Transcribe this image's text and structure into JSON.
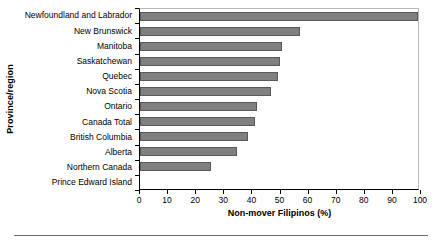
{
  "chart_data": {
    "type": "bar",
    "orientation": "horizontal",
    "title": "",
    "xlabel": "Non-mover Filipinos (%)",
    "ylabel": "Province/region",
    "xlim": [
      0,
      100
    ],
    "xticks": [
      0,
      10,
      20,
      30,
      40,
      50,
      60,
      70,
      80,
      90,
      100
    ],
    "xtick_labels": [
      "0",
      "10",
      "20",
      "30",
      "40",
      "50",
      "60",
      "70",
      "80",
      "90",
      "100"
    ],
    "grid": false,
    "legend": null,
    "bar_color": "#808080",
    "bar_edge_color": "#595959",
    "categories": [
      "Newfoundland and Labrador",
      "New Brunswick",
      "Manitoba",
      "Saskatchewan",
      "Quebec",
      "Nova Scotia",
      "Ontario",
      "Canada Total",
      "British Columbia",
      "Alberta",
      "Northern Canada",
      "Prince Edward Island"
    ],
    "values": [
      100,
      57.5,
      51,
      50.5,
      49.5,
      47,
      42,
      41.5,
      39,
      35,
      25.5,
      0
    ]
  }
}
